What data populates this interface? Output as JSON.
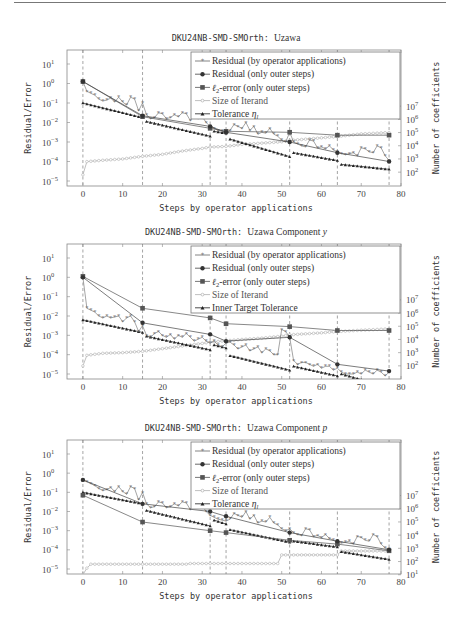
{
  "page": {
    "header_text": "",
    "has_header_rule": true
  },
  "charts_meta": [
    {
      "title_mono": "DKU24NB-SMD-SMOrth:",
      "title_serif": "Uzawa",
      "title_italic": "",
      "frame": {
        "x0": 67,
        "y0": 50,
        "x1": 401,
        "y1": 186
      },
      "left_exp_min": -5,
      "left_exp_max": 1,
      "right_ticks": [
        "10^7",
        "10^6",
        "10^5",
        "10^4",
        "10^3",
        "10^2"
      ],
      "right_exp_top": 7,
      "right_exp_bottom": 2
    },
    {
      "title_mono": "DKU24NB-SMD-SMOrth:",
      "title_serif": "Uzawa Component",
      "title_italic": "y",
      "frame": {
        "x0": 67,
        "y0": 244,
        "x1": 401,
        "y1": 379
      },
      "left_exp_min": -5,
      "left_exp_max": 1,
      "right_ticks": [
        "10^7",
        "10^6",
        "10^5",
        "10^4",
        "10^3",
        "10^2"
      ],
      "right_exp_top": 7,
      "right_exp_bottom": 2
    },
    {
      "title_mono": "DKU24NB-SMD-SMOrth:",
      "title_serif": "Uzawa Component",
      "title_italic": "p",
      "frame": {
        "x0": 67,
        "y0": 440,
        "x1": 401,
        "y1": 574
      },
      "left_exp_min": -5,
      "left_exp_max": 1,
      "right_ticks": [
        "10^7",
        "10^6",
        "10^5",
        "10^4",
        "10^3",
        "10^2",
        "10^1"
      ],
      "right_exp_top": 7,
      "right_exp_bottom": 1
    }
  ],
  "chart_data": [
    {
      "type": "line",
      "title": "DKU24NB-SMD-SMOrth: Uzawa",
      "xlabel": "Steps by operator applications",
      "ylabel": "Residual/Error",
      "ylabel_right": "Number of coefficients",
      "xlim": [
        -4,
        80
      ],
      "x_ticks": [
        0,
        10,
        20,
        30,
        40,
        50,
        60,
        70,
        80
      ],
      "ylim_log": [
        1e-05,
        10
      ],
      "y_ticks": [
        "10^1",
        "10^0",
        "10^-1",
        "10^-2",
        "10^-3",
        "10^-4",
        "10^-5"
      ],
      "y2_ticks": [
        "10^7",
        "10^6",
        "10^5",
        "10^4",
        "10^3",
        "10^2"
      ],
      "vlines": [
        0,
        15,
        32,
        36,
        52,
        64,
        77
      ],
      "legend": [
        "Residual (by operator applications)",
        "Residual (only outer steps)",
        "ℓ2-error (only outer steps)",
        "Size of Iterand",
        "Tolerance ηl"
      ],
      "series": [
        {
          "name": "Residual (by operator applications)",
          "x": [
            0,
            1,
            2,
            3,
            4,
            5,
            6,
            7,
            8,
            9,
            10,
            11,
            12,
            13,
            14,
            15,
            16,
            17,
            18,
            19,
            20,
            21,
            22,
            23,
            24,
            25,
            26,
            27,
            28,
            29,
            30,
            31,
            32,
            33,
            34,
            35,
            36,
            37,
            38,
            39,
            40,
            41,
            42,
            43,
            44,
            45,
            46,
            47,
            48,
            49,
            50,
            51,
            52,
            53,
            54,
            55,
            56,
            57,
            58,
            59,
            60,
            61,
            62,
            63,
            64,
            65,
            66,
            67,
            68,
            69,
            70,
            71,
            72,
            73,
            74,
            75,
            76,
            77
          ],
          "log10y": [
            0.1,
            -0.4,
            -0.5,
            -0.6,
            -0.8,
            -0.9,
            -0.85,
            -0.75,
            -0.95,
            -0.7,
            -0.95,
            -1.1,
            -0.7,
            -0.8,
            -1.4,
            -1.0,
            -1.6,
            -1.8,
            -1.75,
            -1.5,
            -1.55,
            -1.8,
            -1.75,
            -1.6,
            -1.7,
            -1.5,
            -1.55,
            -1.9,
            -1.6,
            -1.8,
            -1.7,
            -2.0,
            -2.2,
            -2.3,
            -2.4,
            -2.45,
            -2.5,
            -2.4,
            -2.1,
            -2.2,
            -2.3,
            -2.0,
            -2.4,
            -2.2,
            -2.6,
            -2.5,
            -2.55,
            -2.3,
            -2.6,
            -2.7,
            -2.9,
            -3.0,
            -2.5,
            -3.0,
            -3.1,
            -3.2,
            -3.25,
            -2.9,
            -2.95,
            -3.3,
            -3.25,
            -3.35,
            -3.2,
            -3.4,
            -3.5,
            -3.6,
            -3.65,
            -3.6,
            -3.55,
            -3.7,
            -3.3,
            -3.35,
            -3.5,
            -3.55,
            -3.2,
            -3.3,
            -3.7,
            -3.95
          ]
        },
        {
          "name": "Residual (only outer steps)",
          "x": [
            0,
            15,
            32,
            36,
            52,
            64,
            77
          ],
          "log10y": [
            0.1,
            -1.65,
            -2.2,
            -2.5,
            -3.0,
            -3.55,
            -4.0
          ]
        },
        {
          "name": "ℓ2-error (only outer steps)",
          "x": [
            0,
            15,
            32,
            36,
            52,
            64,
            77
          ],
          "log10y": [
            0.1,
            -1.7,
            -2.3,
            -2.45,
            -2.5,
            -2.65,
            -2.65
          ]
        },
        {
          "name": "Size of Iterand",
          "axis": "right",
          "x": [
            0,
            1,
            5,
            10,
            15,
            20,
            25,
            30,
            32,
            36,
            40,
            45,
            50,
            52,
            60,
            64,
            70,
            77
          ],
          "log10y_right": [
            1.8,
            2.8,
            2.9,
            3.0,
            3.2,
            3.35,
            3.6,
            3.8,
            3.9,
            3.95,
            4.1,
            4.2,
            4.3,
            4.4,
            4.6,
            4.7,
            4.9,
            5.0
          ]
        },
        {
          "name": "Tolerance ηl",
          "x": [
            0,
            15,
            16,
            32,
            33,
            36,
            37,
            52,
            53,
            64,
            65,
            77
          ],
          "log10y": [
            -1.0,
            -1.75,
            -1.95,
            -2.7,
            -2.45,
            -2.55,
            -2.85,
            -3.75,
            -3.55,
            -3.95,
            -4.15,
            -4.4
          ]
        }
      ]
    },
    {
      "type": "line",
      "title": "DKU24NB-SMD-SMOrth: Uzawa Component y",
      "xlabel": "Steps by operator applications",
      "ylabel": "Residual/Error",
      "ylabel_right": "Number of coefficients",
      "xlim": [
        -4,
        80
      ],
      "x_ticks": [
        0,
        10,
        20,
        30,
        40,
        50,
        60,
        70,
        80
      ],
      "ylim_log": [
        1e-05,
        10
      ],
      "y_ticks": [
        "10^1",
        "10^0",
        "10^-1",
        "10^-2",
        "10^-3",
        "10^-4",
        "10^-5"
      ],
      "y2_ticks": [
        "10^7",
        "10^6",
        "10^5",
        "10^4",
        "10^3",
        "10^2"
      ],
      "vlines": [
        0,
        15,
        32,
        36,
        52,
        64,
        77
      ],
      "legend": [
        "Residual (by operator applications)",
        "Residual (only outer steps)",
        "ℓ2-error (only outer steps)",
        "Size of Iterand",
        "Inner Target Tolerance"
      ],
      "series": [
        {
          "name": "Residual (by operator applications)",
          "x": [
            0,
            1,
            2,
            3,
            4,
            5,
            6,
            7,
            8,
            9,
            10,
            11,
            12,
            13,
            14,
            15,
            16,
            17,
            18,
            19,
            20,
            21,
            22,
            23,
            24,
            25,
            26,
            27,
            28,
            29,
            30,
            31,
            32,
            33,
            34,
            35,
            36,
            37,
            38,
            39,
            40,
            41,
            42,
            43,
            44,
            45,
            46,
            47,
            48,
            49,
            50,
            51,
            52,
            53,
            54,
            55,
            56,
            57,
            58,
            59,
            60,
            61,
            62,
            63,
            64,
            65,
            66,
            67,
            68,
            69,
            70,
            71,
            72,
            73,
            74,
            75,
            76,
            77
          ],
          "log10y": [
            0.0,
            -1.6,
            -1.7,
            -1.8,
            -2.0,
            -2.1,
            -2.0,
            -2.1,
            -2.05,
            -2.0,
            -2.3,
            -2.1,
            -2.0,
            -2.3,
            -2.8,
            -2.5,
            -3.0,
            -3.1,
            -2.9,
            -2.8,
            -3.0,
            -3.1,
            -2.95,
            -3.2,
            -3.0,
            -3.1,
            -2.9,
            -3.1,
            -3.3,
            -3.2,
            -3.1,
            -3.3,
            -3.4,
            -3.3,
            -3.5,
            -3.6,
            -3.4,
            -3.35,
            -3.5,
            -3.7,
            -3.6,
            -3.5,
            -3.8,
            -3.7,
            -3.6,
            -3.9,
            -3.7,
            -3.8,
            -4.0,
            -4.0,
            -2.7,
            -2.8,
            -3.1,
            -4.3,
            -4.5,
            -4.4,
            -4.4,
            -4.5,
            -4.6,
            -4.5,
            -4.7,
            -4.6,
            -4.6,
            -4.8,
            -4.7,
            -4.9,
            -5.0,
            -5.0,
            -5.0,
            -4.9,
            -5.0,
            -4.8,
            -4.9,
            -5.0,
            -4.8,
            -4.9,
            -5.1,
            -4.9
          ]
        },
        {
          "name": "Residual (only outer steps)",
          "x": [
            0,
            15,
            32,
            36,
            52,
            64,
            77
          ],
          "log10y": [
            0.0,
            -2.35,
            -2.95,
            -3.3,
            -3.1,
            -4.5,
            -4.85
          ]
        },
        {
          "name": "ℓ2-error (only outer steps)",
          "x": [
            0,
            15,
            32,
            36,
            52,
            64,
            77
          ],
          "log10y": [
            0.05,
            -1.6,
            -2.1,
            -2.4,
            -2.55,
            -2.75,
            -2.75
          ]
        },
        {
          "name": "Size of Iterand",
          "axis": "right",
          "x": [
            0,
            1,
            5,
            10,
            15,
            20,
            25,
            30,
            32,
            36,
            40,
            45,
            50,
            52,
            60,
            64,
            70,
            77
          ],
          "log10y_right": [
            2.0,
            2.8,
            2.95,
            3.0,
            3.1,
            3.3,
            3.5,
            3.7,
            3.8,
            3.9,
            4.0,
            4.1,
            4.25,
            4.35,
            4.5,
            4.6,
            4.7,
            4.8
          ]
        },
        {
          "name": "Inner Target Tolerance",
          "x": [
            0,
            15,
            16,
            32,
            33,
            36,
            37,
            52,
            53,
            64,
            65,
            77
          ],
          "log10y": [
            -2.2,
            -2.85,
            -3.05,
            -3.75,
            -3.5,
            -3.65,
            -4.05,
            -4.8,
            -4.6,
            -5.1,
            -5.0,
            -5.7
          ]
        }
      ]
    },
    {
      "type": "line",
      "title": "DKU24NB-SMD-SMOrth: Uzawa Component p",
      "xlabel": "Steps by operator applications",
      "ylabel": "Residual/Error",
      "ylabel_right": "Number of coefficients",
      "xlim": [
        -4,
        80
      ],
      "x_ticks": [
        0,
        10,
        20,
        30,
        40,
        50,
        60,
        70,
        80
      ],
      "ylim_log": [
        1e-05,
        10
      ],
      "y_ticks": [
        "10^1",
        "10^0",
        "10^-1",
        "10^-2",
        "10^-3",
        "10^-4",
        "10^-5"
      ],
      "y2_ticks": [
        "10^7",
        "10^6",
        "10^5",
        "10^4",
        "10^3",
        "10^2",
        "10^1"
      ],
      "vlines": [
        0,
        15,
        32,
        36,
        52,
        64,
        77
      ],
      "legend": [
        "Residual (by operator applications)",
        "Residual (only outer steps)",
        "ℓ2-error (only outer steps)",
        "Size of Iterand",
        "Tolerance ηl"
      ],
      "series": [
        {
          "name": "Residual (by operator applications)",
          "x": [
            0,
            1,
            2,
            3,
            4,
            5,
            6,
            7,
            8,
            9,
            10,
            11,
            12,
            13,
            14,
            15,
            16,
            17,
            18,
            19,
            20,
            21,
            22,
            23,
            24,
            25,
            26,
            27,
            28,
            29,
            30,
            31,
            32,
            33,
            34,
            35,
            36,
            37,
            38,
            39,
            40,
            41,
            42,
            43,
            44,
            45,
            46,
            47,
            48,
            49,
            50,
            51,
            52,
            53,
            54,
            55,
            56,
            57,
            58,
            59,
            60,
            61,
            62,
            63,
            64,
            65,
            66,
            67,
            68,
            69,
            70,
            71,
            72,
            73,
            74,
            75,
            76,
            77
          ],
          "log10y": [
            -0.35,
            -0.45,
            -0.55,
            -0.65,
            -0.8,
            -0.9,
            -0.85,
            -0.75,
            -0.95,
            -0.7,
            -0.95,
            -1.1,
            -0.7,
            -0.8,
            -1.4,
            -1.0,
            -1.6,
            -1.8,
            -1.75,
            -1.5,
            -1.55,
            -1.8,
            -1.75,
            -1.6,
            -1.7,
            -1.5,
            -1.55,
            -1.9,
            -1.6,
            -1.8,
            -1.7,
            -2.0,
            -2.2,
            -2.3,
            -2.4,
            -2.45,
            -2.5,
            -2.4,
            -2.1,
            -2.2,
            -2.3,
            -2.0,
            -2.4,
            -2.2,
            -2.6,
            -2.5,
            -2.55,
            -2.3,
            -2.6,
            -2.7,
            -2.9,
            -3.0,
            -2.9,
            -3.1,
            -3.2,
            -3.25,
            -2.9,
            -2.95,
            -3.3,
            -3.25,
            -3.35,
            -3.2,
            -3.4,
            -3.5,
            -3.6,
            -3.65,
            -3.6,
            -3.55,
            -3.7,
            -3.3,
            -3.35,
            -3.5,
            -3.55,
            -3.2,
            -3.3,
            -3.7,
            -3.9,
            -3.95
          ]
        },
        {
          "name": "Residual (only outer steps)",
          "x": [
            0,
            15,
            32,
            36,
            52,
            64,
            77
          ],
          "log10y": [
            -0.35,
            -1.6,
            -2.0,
            -2.25,
            -3.1,
            -3.55,
            -4.0
          ]
        },
        {
          "name": "ℓ2-error (only outer steps)",
          "x": [
            0,
            15,
            32,
            36,
            52,
            64,
            77
          ],
          "log10y": [
            -1.15,
            -2.55,
            -3.0,
            -3.1,
            -3.5,
            -3.7,
            -4.05
          ]
        },
        {
          "name": "Size of Iterand",
          "axis": "right",
          "x": [
            0,
            1,
            2,
            3,
            10,
            20,
            26,
            27,
            30,
            40,
            49,
            50,
            60,
            64,
            65,
            70,
            77
          ],
          "log10y_right": [
            1.0,
            1.5,
            1.8,
            1.8,
            1.8,
            1.8,
            1.8,
            1.85,
            1.85,
            1.85,
            1.85,
            2.5,
            2.5,
            2.5,
            2.8,
            2.8,
            2.8
          ]
        },
        {
          "name": "Tolerance ηl",
          "x": [
            0,
            15,
            16,
            32,
            33,
            36,
            37,
            52,
            53,
            64,
            65,
            77
          ],
          "log10y": [
            -1.0,
            -1.6,
            -1.95,
            -2.75,
            -2.45,
            -2.65,
            -2.95,
            -3.6,
            -3.55,
            -3.85,
            -4.1,
            -4.5
          ]
        }
      ]
    }
  ]
}
